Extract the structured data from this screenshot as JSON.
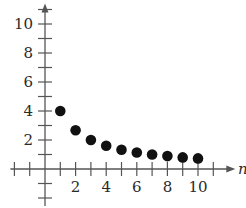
{
  "chart_data": {
    "type": "scatter",
    "title": "",
    "xlabel": "n",
    "ylabel": "",
    "x": [
      1,
      2,
      3,
      4,
      5,
      6,
      7,
      8,
      9,
      10
    ],
    "values": [
      4,
      2.67,
      2,
      1.6,
      1.33,
      1.14,
      1,
      0.89,
      0.8,
      0.73
    ],
    "xlim": [
      -2,
      11
    ],
    "ylim": [
      -2,
      11
    ],
    "x_ticks": [
      2,
      4,
      6,
      8,
      10
    ],
    "y_ticks": [
      2,
      4,
      6,
      8,
      10
    ],
    "x_tick_labels": [
      "2",
      "4",
      "6",
      "8",
      "10"
    ],
    "y_tick_labels": [
      "2",
      "4",
      "6",
      "8",
      "10"
    ],
    "grid": false,
    "legend": null
  },
  "colors": {
    "axis": "#555555",
    "point": "#111111",
    "text": "#2a2a2a"
  }
}
